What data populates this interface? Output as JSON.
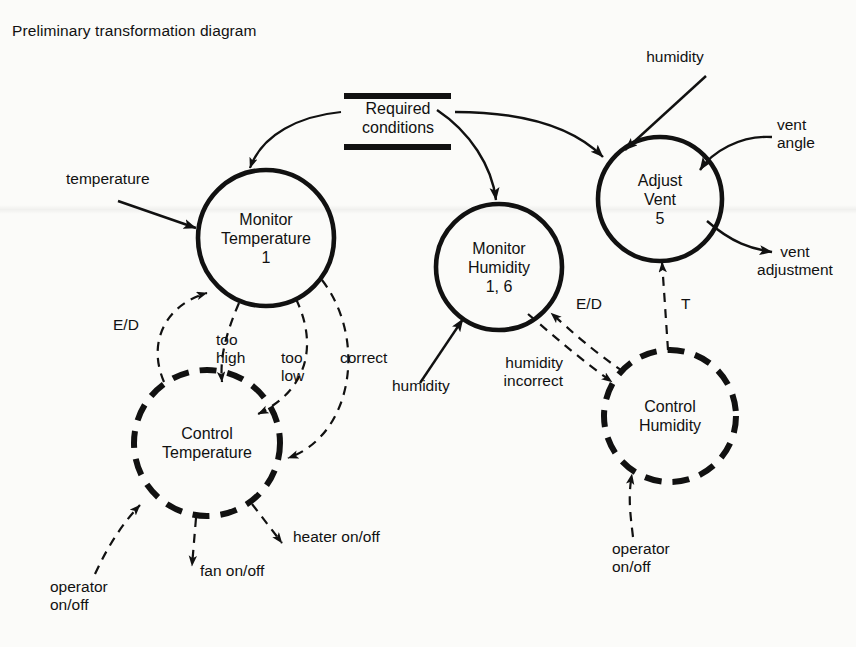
{
  "title": "Preliminary transformation diagram",
  "diagram": {
    "type": "data-flow-control-flow",
    "store": {
      "name": "required-conditions-store",
      "line1": "Required",
      "line2": "conditions"
    },
    "processes": [
      {
        "id": "monitor-temperature",
        "line1": "Monitor",
        "line2": "Temperature",
        "number": "1",
        "style": "solid",
        "cx": 266,
        "cy": 238,
        "r": 68
      },
      {
        "id": "monitor-humidity",
        "line1": "Monitor",
        "line2": "Humidity",
        "number": "1, 6",
        "style": "solid",
        "cx": 499,
        "cy": 267,
        "r": 63
      },
      {
        "id": "adjust-vent",
        "line1": "Adjust",
        "line2": "Vent",
        "number": "5",
        "style": "solid",
        "cx": 660,
        "cy": 199,
        "r": 62
      },
      {
        "id": "control-temperature",
        "line1": "Control",
        "line2": "Temperature",
        "number": "",
        "style": "dashed",
        "cx": 207,
        "cy": 443,
        "r": 73
      },
      {
        "id": "control-humidity",
        "line1": "Control",
        "line2": "Humidity",
        "number": "",
        "style": "dashed",
        "cx": 670,
        "cy": 416,
        "r": 66
      }
    ],
    "flows": [
      {
        "id": "temperature-in",
        "label": "temperature",
        "kind": "data"
      },
      {
        "id": "humidity-in-monitor",
        "label": "humidity",
        "kind": "data"
      },
      {
        "id": "humidity-in-vent",
        "label": "humidity",
        "kind": "data"
      },
      {
        "id": "vent-angle-in",
        "label": "vent\nangle",
        "kind": "data"
      },
      {
        "id": "vent-adjustment-out",
        "label": "vent\nadjustment",
        "kind": "data"
      },
      {
        "id": "ed-temperature",
        "label": "E/D",
        "kind": "control"
      },
      {
        "id": "too-high",
        "label": "too\nhigh",
        "kind": "control"
      },
      {
        "id": "too-low",
        "label": "too\nlow",
        "kind": "control"
      },
      {
        "id": "correct",
        "label": "correct",
        "kind": "control"
      },
      {
        "id": "ed-humidity",
        "label": "E/D",
        "kind": "control"
      },
      {
        "id": "humidity-incorrect",
        "label": "humidity\nincorrect",
        "kind": "control"
      },
      {
        "id": "t-flow",
        "label": "T",
        "kind": "control"
      },
      {
        "id": "operator-on-off-left",
        "label": "operator\non/off",
        "kind": "control"
      },
      {
        "id": "operator-on-off-right",
        "label": "operator\non/off",
        "kind": "control"
      },
      {
        "id": "fan-on-off",
        "label": "fan on/off",
        "kind": "control"
      },
      {
        "id": "heater-on-off",
        "label": "heater on/off",
        "kind": "control"
      }
    ],
    "labels": {
      "temperature": "temperature",
      "humidity_monitor": "humidity",
      "humidity_vent": "humidity",
      "vent_angle_l1": "vent",
      "vent_angle_l2": "angle",
      "vent_adjustment_l1": "vent",
      "vent_adjustment_l2": "adjustment",
      "ed_left": "E/D",
      "too_high_l1": "too",
      "too_high_l2": "high",
      "too_low_l1": "too",
      "too_low_l2": "low",
      "correct": "correct",
      "ed_right": "E/D",
      "humidity_incorrect_l1": "humidity",
      "humidity_incorrect_l2": "incorrect",
      "t": "T",
      "operator_left_l1": "operator",
      "operator_left_l2": "on/off",
      "operator_right_l1": "operator",
      "operator_right_l2": "on/off",
      "fan_on_off": "fan on/off",
      "heater_on_off": "heater on/off"
    },
    "colors": {
      "ink": "#111111",
      "background": "#fbfbf9"
    }
  }
}
